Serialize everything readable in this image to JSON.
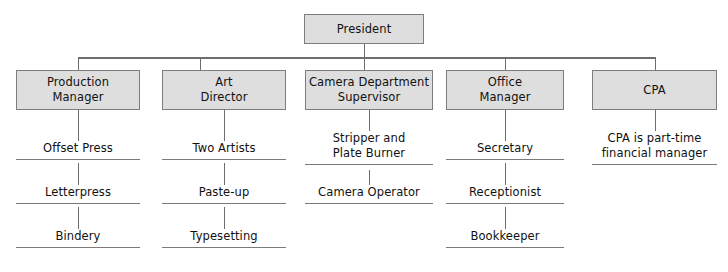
{
  "chart_type": "organization-chart",
  "root": {
    "label": "President"
  },
  "columns": [
    {
      "id": "production",
      "head": "Production\nManager",
      "leaves": [
        "Offset Press",
        "Letterpress",
        "Bindery"
      ]
    },
    {
      "id": "art",
      "head": "Art\nDirector",
      "leaves": [
        "Two Artists",
        "Paste-up",
        "Typesetting"
      ]
    },
    {
      "id": "camera",
      "head": "Camera Department\nSupervisor",
      "leaves": [
        "Stripper and\nPlate Burner",
        "Camera Operator"
      ]
    },
    {
      "id": "office",
      "head": "Office\nManager",
      "leaves": [
        "Secretary",
        "Receptionist",
        "Bookkeeper"
      ]
    },
    {
      "id": "cpa",
      "head": "CPA",
      "leaves": [
        "CPA is part-time\nfinancial manager"
      ]
    }
  ],
  "colors": {
    "box_fill": "#dedede",
    "box_border": "#7d7d7d",
    "line": "#6e6e6e",
    "underline": "#7a7a7a",
    "text": "#111111",
    "background": "#ffffff"
  }
}
